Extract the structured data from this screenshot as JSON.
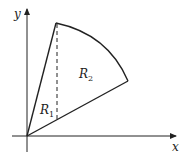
{
  "diagram": {
    "axis_x_label": "x",
    "axis_y_label": "y",
    "region1_label": "R",
    "region1_sub": "1",
    "region2_label": "R",
    "region2_sub": "2",
    "colors": {
      "stroke": "#222222",
      "background": "#ffffff"
    }
  }
}
